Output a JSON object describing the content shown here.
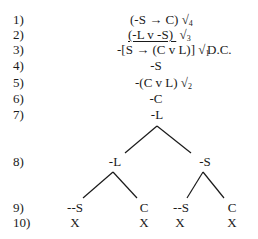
{
  "lines": [
    {
      "num": "1)",
      "formula": "(-S → C)",
      "check": "√",
      "check_sub": "4"
    },
    {
      "num": "2)",
      "formula": "(-L v -S)",
      "check": "√",
      "check_sub": "3"
    },
    {
      "num": "3)",
      "formula": "-[S → (C v L)]",
      "check": "√",
      "check_sub": "1",
      "note": "D.C."
    },
    {
      "num": "4)",
      "formula": "-S"
    },
    {
      "num": "5)",
      "formula": "-(C v L)",
      "check": "√",
      "check_sub": "2"
    },
    {
      "num": "6)",
      "formula": "-C"
    },
    {
      "num": "7)",
      "formula": "-L"
    },
    {
      "num": "8)"
    },
    {
      "num": "9)"
    },
    {
      "num": "10)"
    }
  ],
  "tree": {
    "branch1": {
      "left": "-L",
      "right": "-S"
    },
    "left_sub": {
      "left": "--S",
      "right": "C",
      "left_close": "X",
      "right_close": "X"
    },
    "right_sub": {
      "left": "--S",
      "right": "C",
      "left_close": "X",
      "right_close": "X"
    }
  }
}
